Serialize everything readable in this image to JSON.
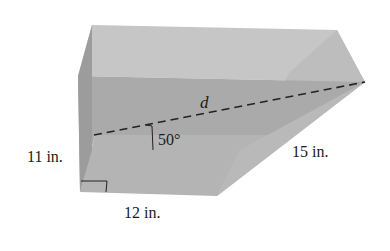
{
  "figure": {
    "type": "triangular prism (right prism with right-triangle base) with space diagonal",
    "labels": {
      "height": "11 in.",
      "base_leg": "12 in.",
      "slant_edge": "15 in.",
      "diagonal": "d",
      "angle": "50°"
    },
    "colors": {
      "top_face": "#c4c4c4",
      "front_face": "#a8a8a8",
      "bottom_face": "#b6b6b6",
      "slant_face": "#bdbdbd",
      "left_end": "#9a9a9a",
      "dashed_line": "#222222",
      "text": "#1a1a1a",
      "background": "#ffffff"
    }
  }
}
